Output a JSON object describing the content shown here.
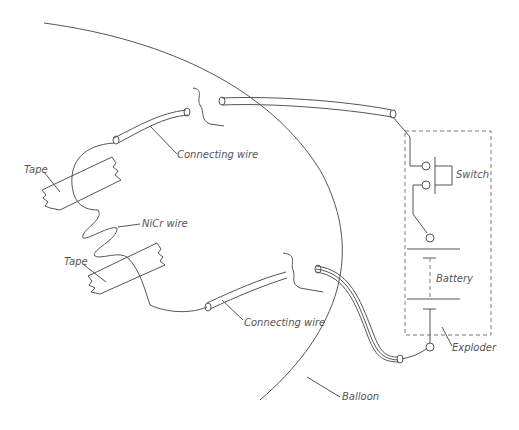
{
  "diagram": {
    "labels": {
      "tape_upper": "Tape",
      "tape_lower": "Tape",
      "connecting_wire_upper": "Connecting wire",
      "connecting_wire_lower": "Connecting wire",
      "nicr_wire": "NiCr wire",
      "switch": "Switch",
      "battery": "Battery",
      "exploder": "Exploder",
      "balloon": "Balloon"
    },
    "colors": {
      "stroke": "#555555",
      "background": "#ffffff"
    }
  }
}
